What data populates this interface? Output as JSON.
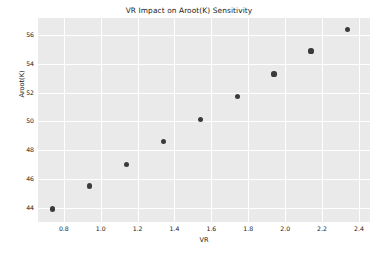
{
  "chart_data": {
    "type": "scatter",
    "title": "VR Impact on Aroot(K) Sensitivity",
    "xlabel": "VR",
    "ylabel": "Aroot(K)",
    "xlim": [
      0.66,
      2.46
    ],
    "ylim": [
      43.0,
      57.2
    ],
    "grid": true,
    "legend": null,
    "xticks": [
      "0.8",
      "1.0",
      "1.2",
      "1.4",
      "1.6",
      "1.8",
      "2.0",
      "2.2",
      "2.4"
    ],
    "xtick_values": [
      0.8,
      1.0,
      1.2,
      1.4,
      1.6,
      1.8,
      2.0,
      2.2,
      2.4
    ],
    "yticks": [
      "44",
      "46",
      "48",
      "50",
      "52",
      "54",
      "56"
    ],
    "ytick_values": [
      44,
      46,
      48,
      50,
      52,
      54,
      56
    ],
    "series": [
      {
        "name": "Aroot(K) vs VR",
        "marker": "circle",
        "color": "#3b3b3b",
        "points": [
          {
            "x": 0.74,
            "y": 43.9
          },
          {
            "x": 0.94,
            "y": 45.5
          },
          {
            "x": 1.14,
            "y": 47.0
          },
          {
            "x": 1.34,
            "y": 48.6
          },
          {
            "x": 1.54,
            "y": 50.15
          },
          {
            "x": 1.74,
            "y": 51.75
          },
          {
            "x": 1.94,
            "y": 53.3
          },
          {
            "x": 2.14,
            "y": 54.9
          },
          {
            "x": 2.34,
            "y": 56.4
          }
        ]
      }
    ]
  },
  "style": {
    "figure_background": "#ffffff",
    "axes_background": "#eaeaea",
    "grid_color": "#ffffff",
    "text_color": "#1a1a1a",
    "marker_color": "#3b3b3b"
  }
}
